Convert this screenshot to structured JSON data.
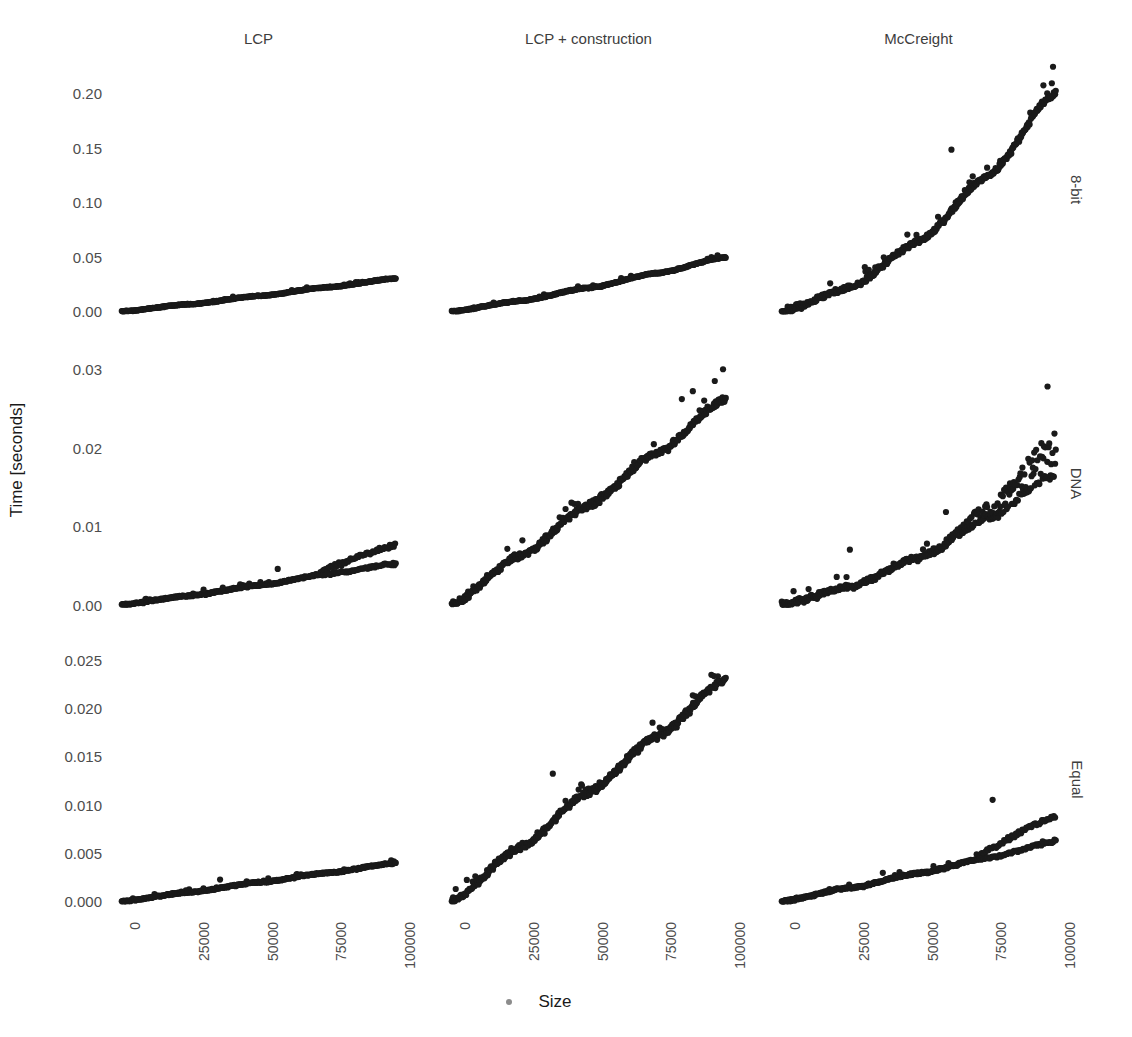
{
  "axes": {
    "y_title": "Time [seconds]",
    "x_title": "Size",
    "x_ticks": [
      "0",
      "25000",
      "50000",
      "75000",
      "100000"
    ],
    "x_tick_values": [
      0,
      25000,
      50000,
      75000,
      100000
    ],
    "x_range": [
      -3000,
      103000
    ]
  },
  "columns": [
    {
      "label": "LCP"
    },
    {
      "label": "LCP + construction"
    },
    {
      "label": "McCreight"
    }
  ],
  "rows": [
    {
      "label": "8-bit",
      "y_ticks": [
        "0.00",
        "0.05",
        "0.10",
        "0.15",
        "0.20"
      ],
      "y_tick_values": [
        0.0,
        0.05,
        0.1,
        0.15,
        0.2
      ],
      "y_range": [
        -0.008,
        0.232
      ]
    },
    {
      "label": "DNA",
      "y_ticks": [
        "0.00",
        "0.01",
        "0.02",
        "0.03"
      ],
      "y_tick_values": [
        0.0,
        0.01,
        0.02,
        0.03
      ],
      "y_range": [
        -0.0012,
        0.0322
      ]
    },
    {
      "label": "Equal",
      "y_ticks": [
        "0.000",
        "0.005",
        "0.010",
        "0.015",
        "0.020",
        "0.025"
      ],
      "y_tick_values": [
        0.0,
        0.005,
        0.01,
        0.015,
        0.02,
        0.025
      ],
      "y_range": [
        -0.0009,
        0.0262
      ]
    }
  ],
  "style": {
    "point_color": "#1a1a1a",
    "point_radius": 3.1,
    "background": "#ffffff",
    "tick_label_color": "#4d4d4d",
    "strip_label_color": "#3d3d3d"
  },
  "chart_data": {
    "type": "scatter",
    "title": "",
    "xlabel": "Size",
    "ylabel": "Time [seconds]",
    "grid": false,
    "legend": "none",
    "facet_rows": [
      "8-bit",
      "DNA",
      "Equal"
    ],
    "facet_cols": [
      "LCP",
      "LCP + construction",
      "McCreight"
    ],
    "xlim": [
      0,
      100000
    ],
    "n_points_per_panel": 420,
    "panels": [
      {
        "row": "8-bit",
        "col": "LCP",
        "ylim": [
          0,
          0.225
        ],
        "shape": "near-linear",
        "model": {
          "form": "a*x + b*x^1.08",
          "a": 2e-07,
          "b": 4e-08
        },
        "y_at_x": {
          "0": 0.0,
          "25000": 0.0065,
          "50000": 0.014,
          "75000": 0.022,
          "100000": 0.03
        },
        "noise_sd": 0.00035,
        "outliers": []
      },
      {
        "row": "8-bit",
        "col": "LCP + construction",
        "ylim": [
          0,
          0.225
        ],
        "shape": "near-linear-slight-curve",
        "y_at_x": {
          "0": 0.0,
          "25000": 0.0095,
          "50000": 0.0215,
          "75000": 0.035,
          "100000": 0.0495
        },
        "noise_sd": 0.0005,
        "outliers": [
          [
            97000,
            0.0512
          ]
        ]
      },
      {
        "row": "8-bit",
        "col": "McCreight",
        "ylim": [
          0,
          0.225
        ],
        "shape": "superlinear",
        "model": {
          "form": "c*x^1.62",
          "c": 9.5e-09
        },
        "y_at_x": {
          "0": 0.0,
          "25000": 0.0215,
          "50000": 0.064,
          "75000": 0.1235,
          "100000": 0.2
        },
        "noise_sd": 0.0022,
        "outliers": [
          [
            62000,
            0.148
          ],
          [
            95500,
            0.207
          ],
          [
            99000,
            0.224
          ]
        ]
      },
      {
        "row": "DNA",
        "col": "LCP",
        "ylim": [
          0,
          0.032
        ],
        "shape": "linear-with-bifurcation",
        "y_at_x": {
          "0": 0.0,
          "25000": 0.00115,
          "50000": 0.00245,
          "75000": 0.0039,
          "100000": 0.0052
        },
        "branch_split_x": 72000,
        "upper_branch_y_at_100000": 0.00755,
        "noise_sd": 9e-05,
        "outliers": [
          [
            57000,
            0.00455
          ],
          [
            30000,
            0.0019
          ],
          [
            37000,
            0.00215
          ]
        ]
      },
      {
        "row": "DNA",
        "col": "LCP + construction",
        "ylim": [
          0,
          0.032
        ],
        "shape": "linear",
        "y_at_x": {
          "0": 0.0,
          "25000": 0.0062,
          "50000": 0.0127,
          "75000": 0.0194,
          "100000": 0.0262
        },
        "noise_sd": 0.00035,
        "outliers": [
          [
            99000,
            0.03
          ],
          [
            96000,
            0.0285
          ],
          [
            88000,
            0.0272
          ],
          [
            84000,
            0.0262
          ]
        ]
      },
      {
        "row": "DNA",
        "col": "McCreight",
        "ylim": [
          0,
          0.032
        ],
        "shape": "superlinear-with-upper-scatter",
        "y_at_x": {
          "0": 0.0,
          "25000": 0.0023,
          "50000": 0.006,
          "75000": 0.0109,
          "100000": 0.0166
        },
        "scatter_onset_x": 55000,
        "scatter_spread_at_100000": 0.0055,
        "noise_sd": 0.0003,
        "outliers": [
          [
            25000,
            0.007
          ],
          [
            97000,
            0.0278
          ],
          [
            60000,
            0.0118
          ]
        ]
      },
      {
        "row": "Equal",
        "col": "LCP",
        "ylim": [
          0,
          0.026
        ],
        "shape": "linear",
        "y_at_x": {
          "0": 0.0,
          "25000": 0.00095,
          "50000": 0.00195,
          "75000": 0.00295,
          "100000": 0.00395
        },
        "noise_sd": 7e-05,
        "outliers": [
          [
            36000,
            0.00225
          ]
        ]
      },
      {
        "row": "Equal",
        "col": "LCP + construction",
        "ylim": [
          0,
          0.026
        ],
        "shape": "linear",
        "y_at_x": {
          "0": 0.0,
          "25000": 0.00555,
          "50000": 0.0113,
          "75000": 0.0171,
          "100000": 0.023
        },
        "noise_sd": 0.0003,
        "outliers": [
          [
            37000,
            0.0132
          ],
          [
            88000,
            0.0213
          ]
        ]
      },
      {
        "row": "Equal",
        "col": "McCreight",
        "ylim": [
          0,
          0.026
        ],
        "shape": "linear-with-bifurcation",
        "y_at_x": {
          "0": 0.0,
          "25000": 0.0014,
          "50000": 0.0029,
          "75000": 0.0045,
          "100000": 0.0062
        },
        "branch_split_x": 72000,
        "upper_branch_y_at_100000": 0.0088,
        "noise_sd": 0.0001,
        "outliers": [
          [
            37000,
            0.00295
          ],
          [
            77000,
            0.0105
          ]
        ]
      }
    ]
  }
}
